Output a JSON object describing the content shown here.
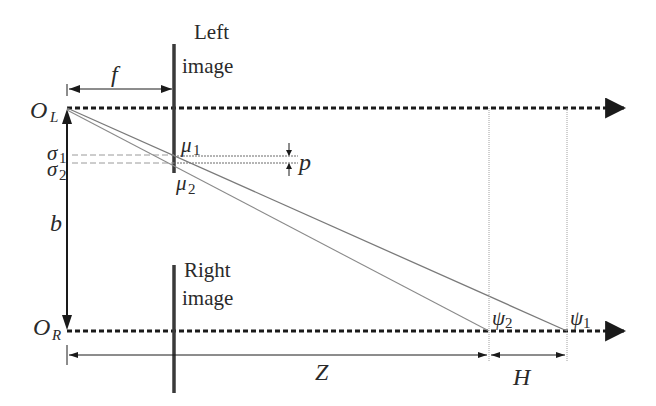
{
  "diagram": {
    "type": "stereo-vision-geometry",
    "colors": {
      "stroke": "#1a1a1a",
      "plane": "#3a3a3a",
      "ray": "#7a7a7a",
      "guide": "#9a9a9a",
      "text": "#2a2a2a"
    },
    "labels": {
      "left_image_line1": "Left",
      "left_image_line2": "image",
      "right_image_line1": "Right",
      "right_image_line2": "image",
      "focal_length": "f",
      "left_origin": "O",
      "left_origin_sub": "L",
      "right_origin": "O",
      "right_origin_sub": "R",
      "baseline": "b",
      "sigma1": "σ",
      "sigma1_sub": "1",
      "sigma2": "σ",
      "sigma2_sub": "2",
      "mu1": "μ",
      "mu1_sub": "1",
      "mu2": "μ",
      "mu2_sub": "2",
      "pixel_size": "p",
      "psi1": "ψ",
      "psi1_sub": "1",
      "psi2": "ψ",
      "psi2_sub": "2",
      "depth": "Z",
      "depth_resolution": "H"
    }
  }
}
